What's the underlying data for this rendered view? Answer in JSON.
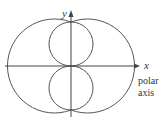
{
  "diagram": {
    "type": "polar-curves",
    "axes": {
      "x_label": "x",
      "y_label": "y",
      "polar_axis_label_line1": "polar",
      "polar_axis_label_line2": "axis"
    },
    "curves": [
      {
        "name": "outer-left-lobe",
        "description": "large left arc"
      },
      {
        "name": "outer-right-lobe",
        "description": "large right arc"
      },
      {
        "name": "inner-upper-loop",
        "description": "small upper circle"
      },
      {
        "name": "inner-lower-loop",
        "description": "small lower circle"
      }
    ],
    "stroke_color": "#555555"
  }
}
